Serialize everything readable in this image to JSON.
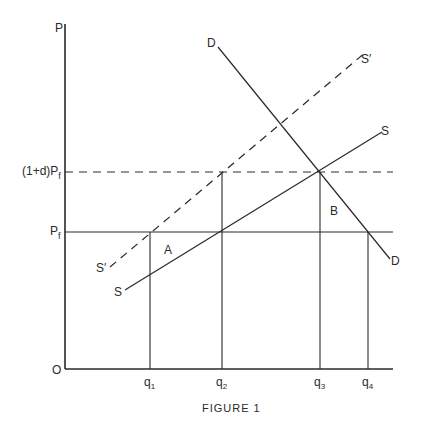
{
  "figure": {
    "caption": "Figure 1",
    "caption_display": "FIGURE 1",
    "axes": {
      "y_label": "P",
      "origin_label": "O",
      "y_ticks": [
        {
          "label_main": "(1+d)P",
          "label_sub": "f",
          "level": "(1+d)Pf"
        },
        {
          "label_main": "P",
          "label_sub": "f",
          "level": "Pf"
        }
      ],
      "x_ticks": [
        {
          "label_main": "q",
          "label_sub": "1"
        },
        {
          "label_main": "q",
          "label_sub": "2"
        },
        {
          "label_main": "q",
          "label_sub": "3"
        },
        {
          "label_main": "q",
          "label_sub": "4"
        }
      ]
    },
    "curves": {
      "supply": {
        "label_start": "S",
        "label_end": "S",
        "style": "solid"
      },
      "supply_shifted": {
        "label_start": "S′",
        "label_end": "S′",
        "style": "dashed"
      },
      "demand": {
        "label_start": "D",
        "label_end": "D",
        "style": "solid"
      }
    },
    "regions": {
      "a": "A",
      "b": "B"
    },
    "colors": {
      "ink": "#2a2a2a",
      "background": "#ffffff"
    }
  }
}
